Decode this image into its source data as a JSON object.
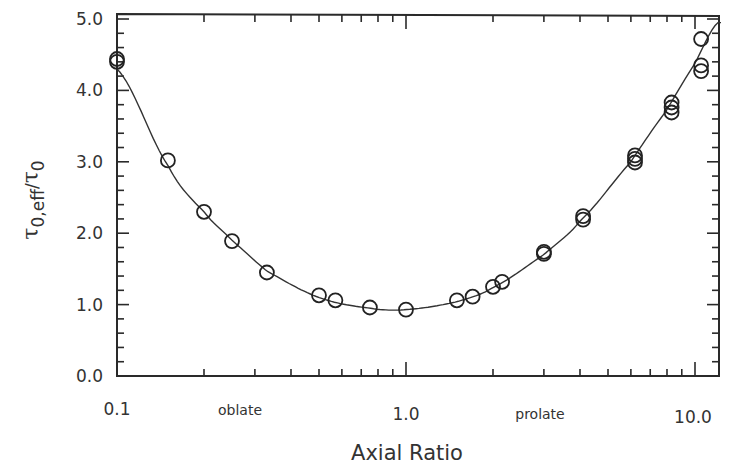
{
  "chart_data": {
    "type": "scatter",
    "title": "",
    "xlabel": "Axial Ratio",
    "ylabel": "τ0,eff/τ0",
    "ylabel_parts": {
      "tau": "τ",
      "sub": "0,eff",
      "slash": "/",
      "tau2": "τ",
      "sub2": "0"
    },
    "xscale": "log",
    "xlim": [
      0.1,
      12.4
    ],
    "ylim": [
      0.0,
      5.0
    ],
    "xticks": [
      0.1,
      1.0,
      10.0
    ],
    "xtick_labels": [
      "0.1",
      "1.0",
      "10.0"
    ],
    "yticks": [
      0.0,
      1.0,
      2.0,
      3.0,
      4.0,
      5.0
    ],
    "ytick_labels": [
      "0.0",
      "1.0",
      "2.0",
      "3.0",
      "4.0",
      "5.0"
    ],
    "grid": false,
    "legend": null,
    "annotations": [
      {
        "text": "oblate",
        "x": 0.25,
        "position": "below-axis"
      },
      {
        "text": "prolate",
        "x": 2.8,
        "position": "below-axis"
      }
    ],
    "series": [
      {
        "name": "measured",
        "marker": "open-circle",
        "x": [
          0.1,
          0.1,
          0.15,
          0.2,
          0.25,
          0.33,
          0.5,
          0.57,
          0.75,
          1.0,
          1.5,
          1.7,
          2.0,
          2.15,
          3.0,
          3.0,
          4.1,
          4.1,
          6.2,
          6.2,
          6.2,
          8.3,
          8.3,
          8.3,
          10.5,
          10.5,
          10.5
        ],
        "y": [
          4.4,
          4.44,
          3.02,
          2.3,
          1.89,
          1.45,
          1.13,
          1.06,
          0.96,
          0.93,
          1.06,
          1.11,
          1.25,
          1.32,
          1.71,
          1.74,
          2.19,
          2.24,
          2.99,
          3.04,
          3.09,
          3.69,
          3.76,
          3.83,
          4.27,
          4.35,
          4.72
        ]
      },
      {
        "name": "fit",
        "type": "line",
        "x": [
          0.1,
          0.15,
          0.2,
          0.25,
          0.33,
          0.5,
          0.75,
          1.0,
          1.5,
          2.0,
          3.0,
          4.0,
          6.0,
          8.0,
          10.0,
          12.0
        ],
        "y": [
          4.3,
          2.95,
          2.3,
          1.9,
          1.47,
          1.1,
          0.95,
          0.93,
          1.04,
          1.24,
          1.7,
          2.17,
          3.0,
          3.73,
          4.38,
          4.95
        ]
      }
    ]
  },
  "labels": {
    "x_title": "Axial Ratio",
    "oblate": "oblate",
    "prolate": "prolate",
    "x_ticks": [
      "0.1",
      "1.0",
      "10.0"
    ],
    "y_ticks": [
      "0.0",
      "1.0",
      "2.0",
      "3.0",
      "4.0",
      "5.0"
    ],
    "y_title_tau": "τ",
    "y_title_sub": "0,eff",
    "y_title_slash": "/",
    "y_title_tau2": "τ",
    "y_title_sub2": "0"
  }
}
